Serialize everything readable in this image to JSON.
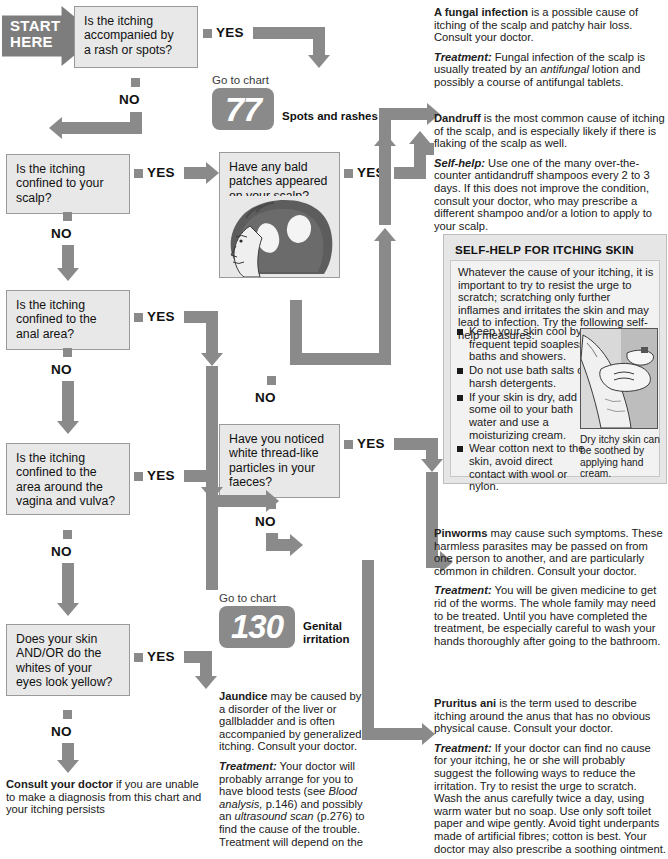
{
  "chart": {
    "start_label": "START\nHERE"
  },
  "questions": [
    {
      "id": "q1",
      "text": "Is the itching\naccompanied by\na rash or spots?"
    },
    {
      "id": "q2",
      "text": "Is the itching\nconfined to your\nscalp?"
    },
    {
      "id": "q3",
      "text": "Is the itching\nconfined to the\nanal area?"
    },
    {
      "id": "q4",
      "text": "Is the itching\nconfined to the\narea around the\nvagina and vulva?"
    },
    {
      "id": "q5",
      "text": "Does your skin\nAND/OR do the\nwhites of your\neyes look yellow?"
    },
    {
      "id": "q6",
      "text": "Have any bald\npatches appeared\non your scalp?"
    },
    {
      "id": "q7",
      "text": "Have you noticed\nwhite thread-like\nparticles in your\nfaeces?"
    }
  ],
  "labels": {
    "yes": "YES",
    "no": "NO"
  },
  "gotocharts": [
    {
      "id": "chart77",
      "prefix": "Go to chart",
      "number": "77",
      "name": "Spots and rashes"
    },
    {
      "id": "chart130",
      "prefix": "Go to chart",
      "number": "130",
      "name": "Genital\nirritation"
    }
  ],
  "advice": {
    "fungal": {
      "lead": "A fungal infection",
      "lead_rest": " is a possible cause of itching of the scalp and patchy hair loss. Consult your doctor.",
      "treat_label": "Treatment:",
      "treat_pre": " Fungal infection of the scalp is usually treated by an ",
      "treat_em": "antifungal",
      "treat_post": " lotion and possibly a course of antifungal tablets."
    },
    "dandruff": {
      "lead": "Dandruff",
      "lead_rest": " is the most common cause of itching of the scalp, and is especially likely if there is flaking of the scalp as well.",
      "treat_label": "Self-help:",
      "treat_rest": " Use one of the many over-the-counter antidandruff shampoos every 2 to 3 days. If this does not improve the condition, consult your doctor, who may prescribe a different shampoo and/or a lotion to apply to your scalp."
    },
    "pinworms": {
      "lead": "Pinworms",
      "lead_rest": " may cause such symptoms. These harmless parasites may be passed on from one person to another, and are particularly common in children. Consult your doctor.",
      "treat_label": "Treatment:",
      "treat_rest": " You will be given medicine to get rid of the worms. The whole family may need to be treated. Until you have completed the treatment, be especially careful to wash your hands thoroughly after going to the bathroom."
    },
    "pruritus": {
      "lead": "Pruritus ani",
      "lead_rest": " is the term used to describe itching around the anus that has no obvious physical cause. Consult your doctor.",
      "treat_label": "Treatment:",
      "treat_rest": " If your doctor can find no cause for your itching, he or she will probably suggest the following ways to reduce the irritation. Try to resist the urge to scratch. Wash the anus carefully twice a day, using warm water but no soap. Use only soft toilet paper and wipe gently. Avoid tight underpants made of artificial fibres; cotton is best. Your doctor may also prescribe a soothing ointment."
    },
    "jaundice": {
      "lead": "Jaundice",
      "lead_rest": " may be caused by a disorder of the liver or gallbladder and is often accompanied by generalized itching. Consult your doctor.",
      "treat_label": "Treatment:",
      "treat_pre": " Your doctor will probably arrange for you to have blood tests (see ",
      "treat_em1": "Blood analysis,",
      "treat_mid": " p.146) and possibly an ",
      "treat_em2": "ultrasound scan",
      "treat_post": " (p.276) to find the cause of the trouble. Treatment will depend on the"
    }
  },
  "selfhelp": {
    "title": "SELF-HELP FOR ITCHING SKIN",
    "intro": "Whatever the cause of your itching, it is important to try to resist the urge to scratch; scratching only further inflames and irritates the skin and may lead to infection. Try the following self-help measures:",
    "bullets": [
      "Keep your skin cool by frequent tepid soapless baths and showers.",
      "Do not use bath salts or harsh detergents.",
      "If your skin is dry, add some oil to your bath water and use a moisturizing cream.",
      "Wear cotton next to the skin, avoid direct contact with wool or nylon."
    ],
    "caption": "Dry itchy skin can be soothed by applying hand cream."
  },
  "footer": {
    "lead": "Consult your doctor",
    "rest": " if you are unable to make a diagnosis from this chart and your itching persists"
  },
  "colors": {
    "arrow_grey": "#8a8a8a",
    "box_fill": "#e8e8e8",
    "panel_fill": "#e6e6e6"
  }
}
